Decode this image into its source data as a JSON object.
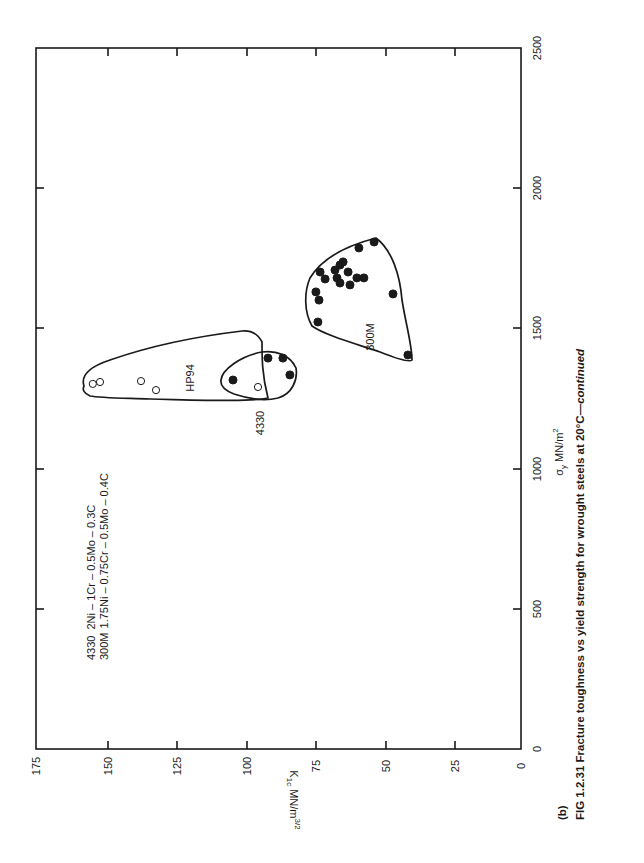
{
  "chart_data": {
    "type": "scatter",
    "title": "FIG 1.2.31 Fracture toughness vs yield strength for wrought steels at 20°C—continued",
    "panel_label": "(b)",
    "orientation": "page rotated 90° counter-clockwise",
    "xlabel": "σy MN/m²",
    "ylabel": "K1c MN/m^3/2",
    "xlim": [
      0,
      2500
    ],
    "ylim": [
      0,
      175
    ],
    "x_ticks": [
      0,
      500,
      1000,
      1500,
      2000,
      2500
    ],
    "y_ticks": [
      0,
      25,
      50,
      75,
      100,
      125,
      150,
      175
    ],
    "grid": false,
    "legend": [
      {
        "code": "4330",
        "composition": "2Ni – 1Cr – 0.5Mo – 0.3C"
      },
      {
        "code": "300M",
        "composition": "1.75Ni – 0.75Cr – 0.5Mo – 0.4C"
      }
    ],
    "series": [
      {
        "name": "HP94",
        "marker": "open circle",
        "points": [
          {
            "x": 1302,
            "y": 154.5
          },
          {
            "x": 1309,
            "y": 151.9
          },
          {
            "x": 1312,
            "y": 137.1
          },
          {
            "x": 1280,
            "y": 131.7
          },
          {
            "x": 1291,
            "y": 94.9
          }
        ]
      },
      {
        "name": "4330",
        "marker": "filled circle",
        "points": [
          {
            "x": 1316,
            "y": 103.9
          },
          {
            "x": 1394,
            "y": 91.3
          },
          {
            "x": 1394,
            "y": 85.9
          },
          {
            "x": 1334,
            "y": 83.4
          }
        ]
      },
      {
        "name": "300M",
        "marker": "filled circle",
        "points": [
          {
            "x": 1808,
            "y": 53.0
          },
          {
            "x": 1787,
            "y": 58.5
          },
          {
            "x": 1737,
            "y": 64.2
          },
          {
            "x": 1701,
            "y": 72.5
          },
          {
            "x": 1676,
            "y": 70.7
          },
          {
            "x": 1708,
            "y": 67.1
          },
          {
            "x": 1680,
            "y": 66.4
          },
          {
            "x": 1726,
            "y": 65.3
          },
          {
            "x": 1701,
            "y": 62.4
          },
          {
            "x": 1680,
            "y": 59.2
          },
          {
            "x": 1655,
            "y": 61.7
          },
          {
            "x": 1662,
            "y": 65.3
          },
          {
            "x": 1680,
            "y": 56.7
          },
          {
            "x": 1630,
            "y": 74.0
          },
          {
            "x": 1601,
            "y": 72.9
          },
          {
            "x": 1523,
            "y": 73.3
          },
          {
            "x": 1623,
            "y": 46.2
          },
          {
            "x": 1405,
            "y": 40.8
          }
        ]
      }
    ],
    "annotations": [
      "HP94",
      "4330",
      "300M"
    ]
  },
  "labels": {
    "y_ticks": [
      "0",
      "25",
      "50",
      "75",
      "100",
      "125",
      "150",
      "175"
    ],
    "x_ticks": [
      "0",
      "500",
      "1000",
      "1500",
      "2000",
      "2500"
    ],
    "y_title_main": "K",
    "y_title_sub": "1c",
    "y_title_unit": " MN/m",
    "y_title_exp": "3/2",
    "x_title_sigma": "σ",
    "x_title_sub": "y",
    "x_title_unit": " MN/m",
    "x_title_exp": "2",
    "legend_4330_code": "4330",
    "legend_4330_comp": "2Ni – 1Cr – 0.5Mo – 0.3C",
    "legend_300m_code": "300M",
    "legend_300m_comp": "1.75Ni – 0.75Cr – 0.5Mo – 0.4C",
    "group_hp94": "HP94",
    "group_4330": "4330",
    "group_300m": "300M",
    "panel": "(b)",
    "caption_main": "FIG 1.2.31 Fracture toughness vs yield strength for wrought steels at 20°C—",
    "caption_italic": "continued"
  }
}
